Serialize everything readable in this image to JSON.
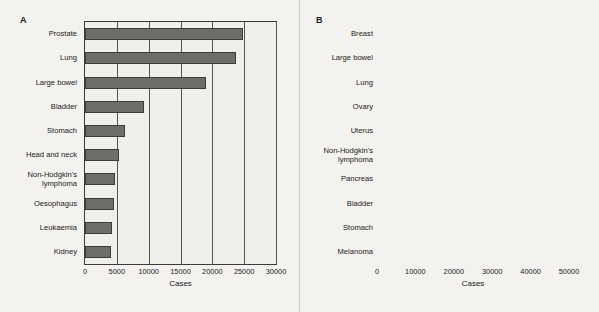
{
  "figure": {
    "panels": [
      {
        "letter": "A",
        "xlabel": "Cases",
        "ticks": [
          "0",
          "5000",
          "10000",
          "15000",
          "20000",
          "25000",
          "30000"
        ],
        "categories": [
          "Prostate",
          "Lung",
          "Large bowel",
          "Bladder",
          "Stomach",
          "Head and neck",
          "Non-Hodgkin's\nlymphoma",
          "Oesophagus",
          "Leukaemia",
          "Kidney"
        ],
        "values": [
          24800,
          23700,
          19000,
          9200,
          6350,
          5350,
          4700,
          4500,
          4200,
          4050
        ]
      },
      {
        "letter": "B",
        "xlabel": "Cases",
        "ticks": [
          "0",
          "10000",
          "20000",
          "30000",
          "40000",
          "50000"
        ],
        "categories": [
          "Breast",
          "Large bowel",
          "Lung",
          "Ovary",
          "Uterus",
          "Non-Hodgkin's\nlymphoma",
          "Pancreas",
          "Bladder",
          "Stomach",
          "Melanoma"
        ],
        "values": [
          41000,
          16400,
          14100,
          6800,
          5700,
          4600,
          3900,
          3800,
          3600,
          3600
        ]
      }
    ]
  },
  "chart_data": [
    {
      "type": "bar",
      "title": "A",
      "orientation": "horizontal",
      "categories": [
        "Prostate",
        "Lung",
        "Large bowel",
        "Bladder",
        "Stomach",
        "Head and neck",
        "Non-Hodgkin's lymphoma",
        "Oesophagus",
        "Leukaemia",
        "Kidney"
      ],
      "values": [
        24800,
        23700,
        19000,
        9200,
        6350,
        5350,
        4700,
        4500,
        4200,
        4050
      ],
      "xlabel": "Cases",
      "ylabel": "",
      "xlim": [
        0,
        30000
      ],
      "xticks": [
        0,
        5000,
        10000,
        15000,
        20000,
        25000,
        30000
      ],
      "grid": true,
      "legend": false,
      "bar_color": "#6e6d69",
      "plot_background": "#d2d1cd"
    },
    {
      "type": "bar",
      "title": "B",
      "orientation": "horizontal",
      "categories": [
        "Breast",
        "Large bowel",
        "Lung",
        "Ovary",
        "Uterus",
        "Non-Hodgkin's lymphoma",
        "Pancreas",
        "Bladder",
        "Stomach",
        "Melanoma"
      ],
      "values": [
        41000,
        16400,
        14100,
        6800,
        5700,
        4600,
        3900,
        3800,
        3600,
        3600
      ],
      "xlabel": "Cases",
      "ylabel": "",
      "xlim": [
        0,
        50000
      ],
      "xticks": [
        0,
        10000,
        20000,
        30000,
        40000,
        50000
      ],
      "grid": true,
      "legend": false,
      "bar_color": "#6e6d69",
      "plot_background": "#d2d1cd"
    }
  ]
}
